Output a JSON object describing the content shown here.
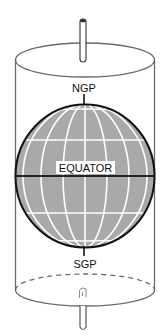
{
  "figure": {
    "caption_fragment": "",
    "labels": {
      "north_pole": "NGP",
      "south_pole": "SGP",
      "equator": "EQUATOR"
    },
    "colors": {
      "globe_fill": "#a9a9a9",
      "grid_lines": "#ffffff",
      "outline": "#111111",
      "cylinder": "#6a6a6a",
      "background": "#ffffff"
    },
    "parts": [
      "axis-rod-top",
      "cylinder-top-ellipse",
      "cylinder-walls",
      "globe-sphere",
      "latitude-lines",
      "meridian-lines",
      "equator-line",
      "cylinder-bottom-ellipse",
      "axis-rod-bottom"
    ]
  }
}
